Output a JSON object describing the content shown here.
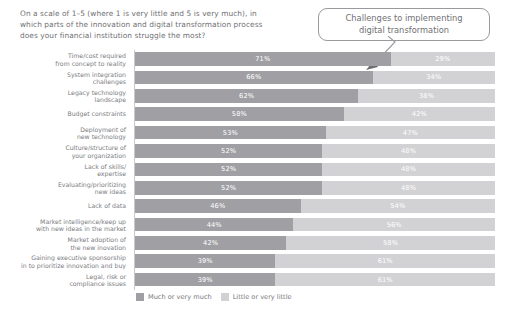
{
  "question": "On a scale of 1–5 (where 1 is very little and 5 is very much), in which parts of the innovation and digital transformation process does your financial institution struggle the most?",
  "callout": {
    "line1": "Challenges to implementing",
    "line2": "digital transformation",
    "text": "Challenges to implementing digital transformation",
    "border_color": "#9a9a9e"
  },
  "legend": {
    "items": [
      {
        "label": "Much or very much",
        "color": "#a0a0a4"
      },
      {
        "label": "Little or very little",
        "color": "#d2d2d4"
      }
    ]
  },
  "chart_data": {
    "type": "bar",
    "orientation": "horizontal",
    "stacked": true,
    "normalized_percent": true,
    "title": "On a scale of 1–5 (where 1 is very little and 5 is very much), in which parts of the innovation and digital transformation process does your financial institution struggle the most?",
    "annotation": "Challenges to implementing digital transformation",
    "xlabel": "",
    "ylabel": "",
    "xlim": [
      0,
      100
    ],
    "grid": false,
    "legend_position": "bottom-left",
    "categories": [
      "Time/cost required from concept to reality",
      "System integration challenges",
      "Legacy technology landscape",
      "Budget constraints",
      "Deployment of new technology",
      "Culture/structure of your organization",
      "Lack of skills/ expertise",
      "Evaluating/prioritizing new ideas",
      "Lack of data",
      "Market intelligence/keep up with new ideas in the market",
      "Market adoption of the new inovation",
      "Gaining executive sponsorship in to prioritize innovation and buy",
      "Legal, risk or compliance issues"
    ],
    "series": [
      {
        "name": "Much or very much",
        "color": "#a0a0a4",
        "values": [
          71,
          66,
          62,
          58,
          53,
          52,
          52,
          52,
          46,
          44,
          42,
          39,
          39
        ],
        "labels": [
          "71%",
          "66%",
          "62%",
          "58%",
          "53%",
          "52%",
          "52%",
          "52%",
          "46%",
          "44%",
          "42%",
          "39%",
          "39%"
        ]
      },
      {
        "name": "Little or very little",
        "color": "#d2d2d4",
        "values": [
          29,
          34,
          38,
          42,
          47,
          48,
          48,
          48,
          54,
          56,
          58,
          61,
          61
        ],
        "labels": [
          "29%",
          "34%",
          "38%",
          "42%",
          "47%",
          "48%",
          "48%",
          "48%",
          "54%",
          "56%",
          "58%",
          "61%",
          "61%"
        ]
      }
    ],
    "rows": [
      {
        "category_line1": "Time/cost required",
        "category_line2": "from concept to reality",
        "a": 71,
        "b": 29,
        "a_label": "71%",
        "b_label": "29%"
      },
      {
        "category_line1": "System integration",
        "category_line2": "challenges",
        "a": 66,
        "b": 34,
        "a_label": "66%",
        "b_label": "34%"
      },
      {
        "category_line1": "Legacy technology",
        "category_line2": "landscape",
        "a": 62,
        "b": 38,
        "a_label": "62%",
        "b_label": "38%"
      },
      {
        "category_line1": "Budget constraints",
        "category_line2": "",
        "a": 58,
        "b": 42,
        "a_label": "58%",
        "b_label": "42%"
      },
      {
        "category_line1": "Deployment of",
        "category_line2": "new technology",
        "a": 53,
        "b": 47,
        "a_label": "53%",
        "b_label": "47%"
      },
      {
        "category_line1": "Culture/structure of",
        "category_line2": "your organization",
        "a": 52,
        "b": 48,
        "a_label": "52%",
        "b_label": "48%"
      },
      {
        "category_line1": "Lack of skills/",
        "category_line2": "expertise",
        "a": 52,
        "b": 48,
        "a_label": "52%",
        "b_label": "48%"
      },
      {
        "category_line1": "Evaluating/prioritizing",
        "category_line2": "new ideas",
        "a": 52,
        "b": 48,
        "a_label": "52%",
        "b_label": "48%"
      },
      {
        "category_line1": "Lack of data",
        "category_line2": "",
        "a": 46,
        "b": 54,
        "a_label": "46%",
        "b_label": "54%"
      },
      {
        "category_line1": "Market intelligence/keep up",
        "category_line2": "with new ideas in the market",
        "a": 44,
        "b": 56,
        "a_label": "44%",
        "b_label": "56%"
      },
      {
        "category_line1": "Market adoption of",
        "category_line2": "the new inovation",
        "a": 42,
        "b": 58,
        "a_label": "42%",
        "b_label": "58%"
      },
      {
        "category_line1": "Gaining executive sponsorship",
        "category_line2": "in to prioritize innovation and buy",
        "a": 39,
        "b": 61,
        "a_label": "39%",
        "b_label": "61%"
      },
      {
        "category_line1": "Legal, risk or",
        "category_line2": "compliance issues",
        "a": 39,
        "b": 61,
        "a_label": "39%",
        "b_label": "61%"
      }
    ]
  }
}
